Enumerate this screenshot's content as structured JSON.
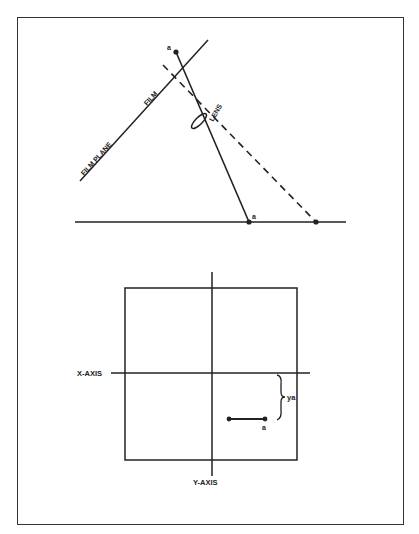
{
  "figure_top": {
    "title": "Film plane / lens projection",
    "labels": {
      "film_plane": "FILM PLANE",
      "film": "FILM",
      "lens": "LENS",
      "point_film": "a",
      "point_ground": "a"
    }
  },
  "figure_bottom": {
    "title": "Coordinate axes on film",
    "labels": {
      "x_axis": "X-AXIS",
      "y_axis": "Y-AXIS",
      "offset": "ya",
      "point": "a"
    }
  },
  "colors": {
    "ink": "#222222",
    "paper": "#ffffff",
    "frame": "#333333"
  }
}
